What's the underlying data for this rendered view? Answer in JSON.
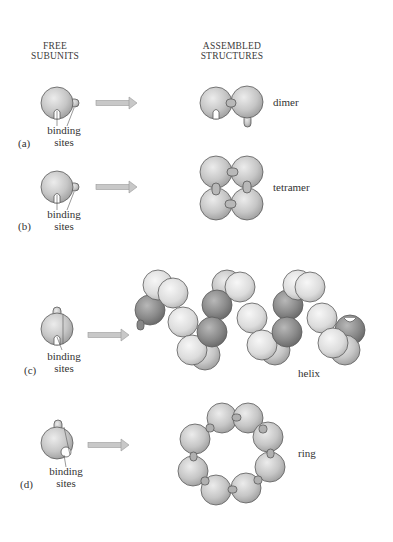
{
  "headers": {
    "free_line1": "FREE",
    "free_line2": "SUBUNITS",
    "assembled_line1": "ASSEMBLED",
    "assembled_line2": "STRUCTURES"
  },
  "panels": [
    {
      "letter": "(a)",
      "sites_line1": "binding",
      "sites_line2": "sites",
      "structure": "dimer"
    },
    {
      "letter": "(b)",
      "sites_line1": "binding",
      "sites_line2": "sites",
      "structure": "tetramer"
    },
    {
      "letter": "(c)",
      "sites_line1": "binding",
      "sites_line2": "sites",
      "structure": "helix"
    },
    {
      "letter": "(d)",
      "sites_line1": "binding",
      "sites_line2": "sites",
      "structure": "ring"
    }
  ],
  "colors": {
    "subunit_fill": "#c4c4c4",
    "subunit_light": "#e6e6e6",
    "subunit_dark": "#8e8e8e",
    "outline": "#5a5a5a",
    "arrow": "#bdbdbd"
  }
}
